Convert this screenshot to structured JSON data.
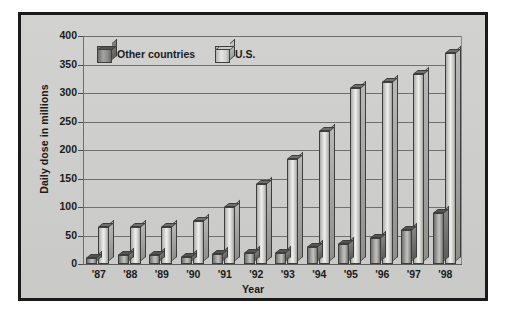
{
  "chart_data": {
    "type": "bar",
    "title": "",
    "xlabel": "Year",
    "ylabel": "Daily dose in millions",
    "categories": [
      "'87",
      "'88",
      "'89",
      "'90",
      "'91",
      "'92",
      "'93",
      "'94",
      "'95",
      "'96",
      "'97",
      "'98"
    ],
    "series": [
      {
        "name": "Other countries",
        "values": [
          10,
          15,
          15,
          13,
          18,
          20,
          20,
          30,
          35,
          45,
          60,
          90
        ]
      },
      {
        "name": "U.S.",
        "values": [
          65,
          65,
          65,
          75,
          100,
          140,
          185,
          233,
          308,
          320,
          333,
          370
        ]
      }
    ],
    "ylim": [
      0,
      400
    ],
    "yticks": [
      0,
      50,
      100,
      150,
      200,
      250,
      300,
      350,
      400
    ],
    "ytick_labels": [
      "0",
      "50",
      "100",
      "150",
      "200",
      "250",
      "300",
      "350",
      "400"
    ],
    "grid": true,
    "legend_position": "upper-left-inside"
  },
  "legend": {
    "items": [
      {
        "label": "Other countries",
        "style": "dark",
        "swatch_icon": "cube-dark-icon"
      },
      {
        "label": "U.S.",
        "style": "light",
        "swatch_icon": "cube-light-icon"
      }
    ]
  },
  "colors": {
    "frame_border": "#1a1a1a",
    "panel_background": "#cfcfcd",
    "gridline": "#6f6f6f",
    "text": "#1b1b1b",
    "bar_other_countries": "#8f8f8c",
    "bar_us": "#d8d8d5"
  }
}
